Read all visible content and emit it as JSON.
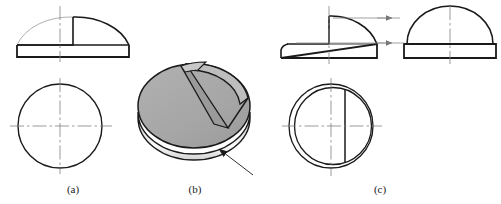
{
  "figure": {
    "background_color": "#ffffff",
    "line_color": "#1a1a1a",
    "thin_line_color": "#8c8c8c",
    "center_line_color": "#808080",
    "solid_top_fill": "#a8a8a8",
    "solid_notch_fill": "#9a9a9a",
    "solid_side_light": "#f2f2f2",
    "solid_side_dark": "#b0b0b0",
    "width": 501,
    "height": 204
  },
  "captions": {
    "a": "(a)",
    "b": "(b)",
    "c": "(c)"
  },
  "panels": [
    {
      "id": "a",
      "label": "(a)",
      "description": "Incorrect front view and top view: front view shows half dome with square notch cut, top view is a plain circle",
      "views": [
        {
          "name": "front-view",
          "type": "half-dome-with-notch",
          "center_x": 73,
          "base_y": 57,
          "radius_x": 56,
          "radius_y": 40,
          "base_band_height": 12,
          "notch": {
            "left_x": 30,
            "top_y": 22,
            "right_x": 73
          }
        },
        {
          "name": "top-view",
          "type": "circle",
          "center_x": 60,
          "center_y": 126,
          "radius": 42
        }
      ],
      "centerlines": [
        {
          "name": "front-vertical",
          "x": 60,
          "y1": 6,
          "y2": 62
        },
        {
          "name": "top-vertical",
          "x": 60,
          "y1": 78,
          "y2": 174
        },
        {
          "name": "top-horizontal",
          "y": 126,
          "x1": 10,
          "x2": 112
        }
      ]
    },
    {
      "id": "b",
      "label": "(b)",
      "description": "Shaded isometric pictorial of the solid: a truncated hemisphere with a wedge-shaped notch cut from the top, with a leader arrow pointing at the cylindrical base band",
      "solid": {
        "name": "truncated-hemisphere-with-notch",
        "center_x": 194,
        "center_y": 112,
        "radius_x": 56,
        "radius_y": 42,
        "band_height": 22
      },
      "arrow": {
        "name": "leader-arrow",
        "from_x": 253,
        "from_y": 175,
        "to_x": 218,
        "to_y": 148,
        "direction": "up-left"
      }
    },
    {
      "id": "c",
      "label": "(c)",
      "description": "Correct front view, projected side view and top view: notch projects as visible edges; top view shows double circle with a vertical cut line",
      "views": [
        {
          "name": "front-view",
          "type": "half-dome-with-raised-notch",
          "center_x": 329,
          "base_y": 58,
          "radius_x": 48,
          "radius_y": 40,
          "base_band_height": 14
        },
        {
          "name": "side-view",
          "type": "half-dome-truncated",
          "center_x": 450,
          "base_y": 58,
          "radius_x": 43,
          "radius_y": 38,
          "base_band_height": 14
        },
        {
          "name": "top-view",
          "type": "double-circle-with-cut-line",
          "center_x": 331,
          "center_y": 126,
          "outer_radius": 42,
          "inner_radius": 38,
          "cut_line_x": 345
        }
      ],
      "projection_arrows": [
        {
          "name": "projection-arrow-upper",
          "x1": 355,
          "y1": 18,
          "x2": 392,
          "y2": 18
        },
        {
          "name": "projection-arrow-lower",
          "x1": 340,
          "y1": 42,
          "x2": 392,
          "y2": 42
        }
      ],
      "centerlines": [
        {
          "name": "front-vertical",
          "x": 329,
          "y1": 6,
          "y2": 64
        },
        {
          "name": "side-vertical",
          "x": 450,
          "y1": 6,
          "y2": 64
        },
        {
          "name": "top-vertical",
          "x": 331,
          "y1": 78,
          "y2": 176
        },
        {
          "name": "top-horizontal",
          "y": 126,
          "x1": 282,
          "x2": 382
        }
      ]
    }
  ]
}
